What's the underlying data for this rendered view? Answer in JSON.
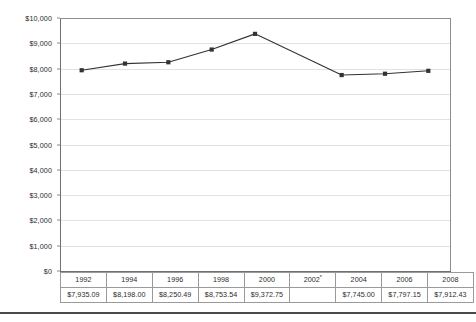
{
  "chart_data": {
    "type": "line",
    "title": "",
    "xlabel": "",
    "ylabel": "",
    "categories": [
      "1992",
      "1994",
      "1996",
      "1998",
      "2000",
      "2002",
      "2004",
      "2006",
      "2008"
    ],
    "values": [
      7935.09,
      8198.0,
      8250.49,
      8753.54,
      9372.75,
      null,
      7745.0,
      7797.15,
      7912.43
    ],
    "ylim": [
      0,
      10000
    ],
    "ytick_step": 1000,
    "ytick_labels": [
      "$0",
      "$1,000",
      "$2,000",
      "$3,000",
      "$4,000",
      "$5,000",
      "$6,000",
      "$7,000",
      "$8,000",
      "$9,000",
      "$10,000"
    ],
    "ytick_values": [
      0,
      1000,
      2000,
      3000,
      4000,
      5000,
      6000,
      7000,
      8000,
      9000,
      10000
    ],
    "grid": true,
    "legend": null,
    "marker": "square",
    "series_color": "#333333",
    "grid_color": "#e2e2e2",
    "axis_color": "#6f6f6f",
    "value_labels": [
      "$7,935.09",
      "$8,198.00",
      "$8,250.49",
      "$8,753.54",
      "$9,372.75",
      "",
      "$7,745.00",
      "$7,797.15",
      "$7,912.43"
    ],
    "category_footnotes": [
      "",
      "",
      "",
      "",
      "",
      "*",
      "",
      "",
      ""
    ],
    "missing_categories": [
      "2002"
    ]
  },
  "table": {
    "year_row": [
      {
        "label": "1992",
        "footnote": ""
      },
      {
        "label": "1994",
        "footnote": ""
      },
      {
        "label": "1996",
        "footnote": ""
      },
      {
        "label": "1998",
        "footnote": ""
      },
      {
        "label": "2000",
        "footnote": ""
      },
      {
        "label": "2002",
        "footnote": "*"
      },
      {
        "label": "2004",
        "footnote": ""
      },
      {
        "label": "2006",
        "footnote": ""
      },
      {
        "label": "2008",
        "footnote": ""
      }
    ],
    "value_row": [
      {
        "label": "$7,935.09",
        "empty": false
      },
      {
        "label": "$8,198.00",
        "empty": false
      },
      {
        "label": "$8,250.49",
        "empty": false
      },
      {
        "label": "$8,753.54",
        "empty": false
      },
      {
        "label": "$9,372.75",
        "empty": false
      },
      {
        "label": "",
        "empty": true
      },
      {
        "label": "$7,745.00",
        "empty": false
      },
      {
        "label": "$7,797.15",
        "empty": false
      },
      {
        "label": "$7,912.43",
        "empty": false
      }
    ]
  }
}
